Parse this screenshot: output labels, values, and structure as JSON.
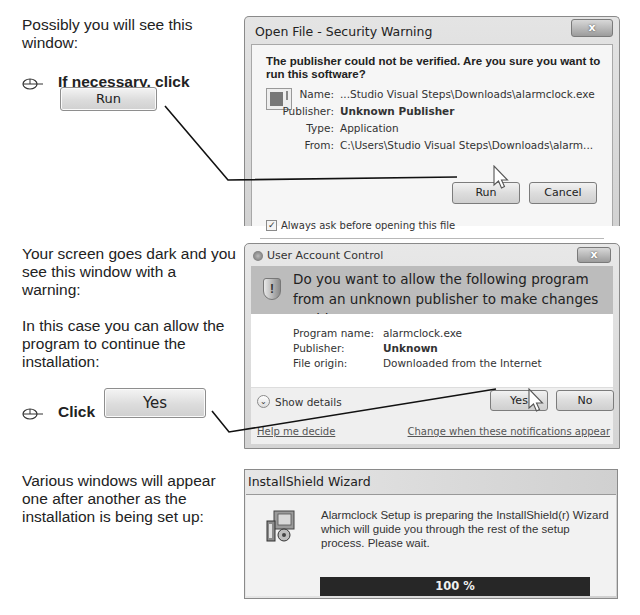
{
  "section1": {
    "instruction": "Possibly you will see this window:",
    "step_text": "If necessary, click",
    "step_button_label": "Run",
    "dialog": {
      "title": "Open File - Security Warning",
      "close_label": "x",
      "heading": "The publisher could not be verified.  Are you sure you want to run this software?",
      "fields": [
        {
          "key": "Name:",
          "value": "...Studio Visual Steps\\Downloads\\alarmclock.exe"
        },
        {
          "key": "Publisher:",
          "value": "Unknown Publisher"
        },
        {
          "key": "Type:",
          "value": "Application"
        },
        {
          "key": "From:",
          "value": "C:\\Users\\Studio Visual Steps\\Downloads\\alarm..."
        }
      ],
      "run_button": "Run",
      "cancel_button": "Cancel",
      "checkbox_label": "Always ask before opening this file",
      "checkbox_checked": true
    }
  },
  "section2": {
    "instruction_1": "Your screen goes dark and you see this window with a warning:",
    "instruction_2": "In this case you can allow the program to continue the installation:",
    "step_text": "Click",
    "step_button_label": "Yes",
    "dialog": {
      "title": "User Account Control",
      "close_label": "x",
      "question": "Do you want to allow the following program from an unknown publisher to make changes to this computer?",
      "fields": [
        {
          "key": "Program name:",
          "value": "alarmclock.exe"
        },
        {
          "key": "Publisher:",
          "value": "Unknown"
        },
        {
          "key": "File origin:",
          "value": "Downloaded from the Internet"
        }
      ],
      "show_details": "Show details",
      "yes_button": "Yes",
      "no_button": "No",
      "help_link": "Help me decide",
      "notifications_link": "Change when these notifications appear"
    }
  },
  "section3": {
    "instruction": "Various windows will appear one after another as the installation is being set up:",
    "dialog": {
      "title": "InstallShield Wizard",
      "message": "Alarmclock Setup is preparing the InstallShield(r) Wizard which will guide you through the rest of the setup process. Please wait.",
      "progress_percent": 100,
      "progress_label": "100 %"
    }
  },
  "colors": {
    "text": "#222222",
    "progress_bar": "#2a2a2a",
    "uac_header": "#bcbcbc"
  }
}
